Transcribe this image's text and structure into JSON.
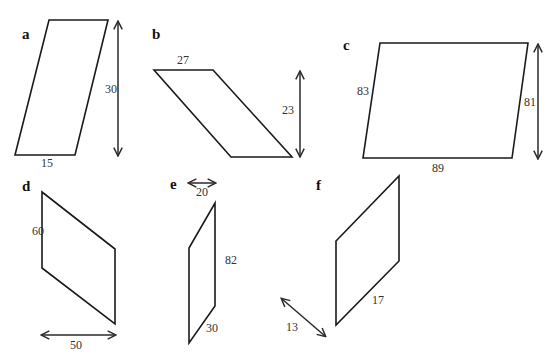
{
  "figure": {
    "panels": {
      "a": {
        "label": "a",
        "base": "15",
        "height": "30"
      },
      "b": {
        "label": "b",
        "base": "27",
        "height": "23"
      },
      "c": {
        "label": "c",
        "side": "83",
        "base": "89",
        "height": "81"
      },
      "d": {
        "label": "d",
        "side": "60",
        "width": "50"
      },
      "e": {
        "label": "e",
        "width": "20",
        "side": "82",
        "slant": "30"
      },
      "f": {
        "label": "f",
        "slant": "17",
        "distance": "13"
      }
    },
    "colors": {
      "stroke": "#1a1a1a",
      "text": "#333333",
      "background": "#ffffff"
    }
  }
}
